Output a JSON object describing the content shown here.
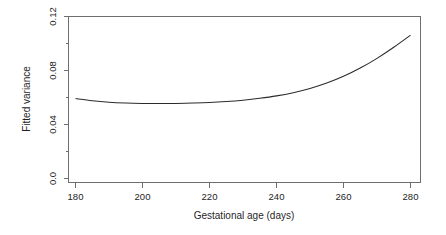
{
  "chart_data": {
    "type": "line",
    "title": "",
    "subtitle": "",
    "xlabel": "Gestational age (days)",
    "ylabel": "Fitted variance",
    "xlim": [
      175,
      283
    ],
    "ylim": [
      0.0,
      0.12
    ],
    "xticks": [
      180,
      200,
      220,
      240,
      260,
      280
    ],
    "xtick_labels": [
      "180",
      "200",
      "220",
      "240",
      "260",
      "280"
    ],
    "yticks": [
      0.0,
      0.04,
      0.08,
      0.12
    ],
    "ytick_labels": [
      "0.0",
      "0.04",
      "0.08",
      "0.12"
    ],
    "ytick_minor": [
      0.02,
      0.06,
      0.1
    ],
    "grid": false,
    "legend": null,
    "annotations": [],
    "series": [
      {
        "name": "Fitted variance",
        "color": "#2b2b2b",
        "x": [
          180,
          185,
          190,
          195,
          200,
          205,
          210,
          215,
          220,
          225,
          230,
          235,
          240,
          245,
          250,
          255,
          260,
          265,
          270,
          275,
          280
        ],
        "y": [
          0.0592,
          0.0576,
          0.0565,
          0.0559,
          0.0556,
          0.0555,
          0.0556,
          0.0559,
          0.0563,
          0.057,
          0.058,
          0.0594,
          0.0612,
          0.0636,
          0.0667,
          0.0707,
          0.0757,
          0.0818,
          0.089,
          0.0972,
          0.1062
        ]
      }
    ]
  },
  "axis": {
    "x_title": "Gestational age (days)",
    "y_title": "Fitted variance"
  }
}
